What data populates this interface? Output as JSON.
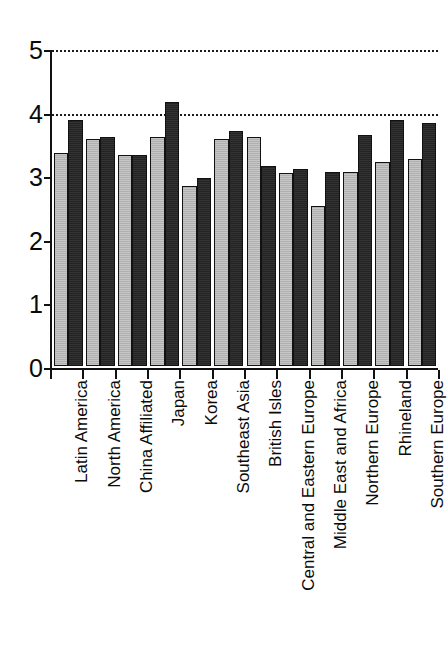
{
  "chart_data": {
    "type": "bar",
    "title": "",
    "subtitle": "",
    "xlabel": "",
    "ylabel": "",
    "ylim": [
      0,
      5
    ],
    "yticks": [
      "0",
      "1",
      "2",
      "3",
      "4",
      "5"
    ],
    "grid": false,
    "legend_position": "none",
    "reference_lines": [
      {
        "value": 5,
        "style": "dotted"
      },
      {
        "value": 4,
        "style": "dotted"
      }
    ],
    "categories": [
      "Latin America",
      "North America",
      "China Affiliated",
      "Japan",
      "Korea",
      "Southeast Asia",
      "British Isles",
      "Central and Eastern Europe",
      "Middle East and Africa",
      "Northern Europe",
      "Rhineland",
      "Southern Europe"
    ],
    "series": [
      {
        "name": "light-gray-series",
        "color": "#b0b0b0",
        "values": [
          3.35,
          3.57,
          3.32,
          3.6,
          2.83,
          3.57,
          3.6,
          3.03,
          2.52,
          3.05,
          3.2,
          3.25
        ]
      },
      {
        "name": "dark-series",
        "color": "#232323",
        "values": [
          3.87,
          3.6,
          3.32,
          4.15,
          2.96,
          3.7,
          3.14,
          3.1,
          3.05,
          3.63,
          3.87,
          3.82
        ]
      }
    ]
  }
}
